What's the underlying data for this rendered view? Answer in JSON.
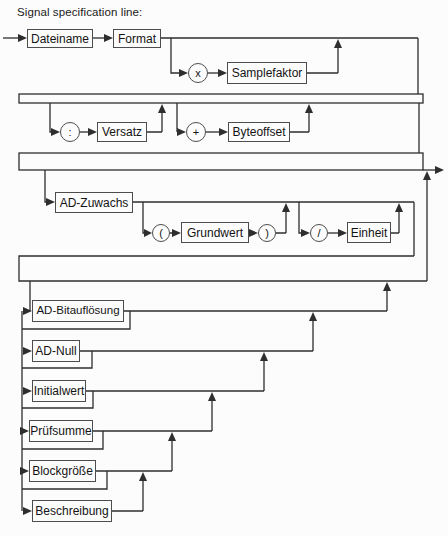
{
  "title": "Signal specification line:",
  "colors": {
    "line": "#2e2e2e",
    "box_border": "#4d4d4d",
    "text": "#141414",
    "background": "#fcfcfc"
  },
  "diagram": {
    "row1": {
      "dateiname": "Dateiname",
      "format": "Format",
      "multiply_op": "x",
      "samplefaktor": "Samplefaktor"
    },
    "row2": {
      "colon_op": ":",
      "versatz": "Versatz",
      "plus_op": "+",
      "byteoffset": "Byteoffset"
    },
    "row3": {
      "ad_zuwachs": "AD-Zuwachs",
      "open_paren_op": "(",
      "grundwert": "Grundwert",
      "close_paren_op": ")",
      "slash_op": "/",
      "einheit": "Einheit"
    },
    "options": [
      {
        "label": "AD-Bitauflösung"
      },
      {
        "label": "AD-Null"
      },
      {
        "label": "Initialwert"
      },
      {
        "label": "Prüfsumme"
      },
      {
        "label": "Blockgröße"
      },
      {
        "label": "Beschreibung"
      }
    ]
  }
}
